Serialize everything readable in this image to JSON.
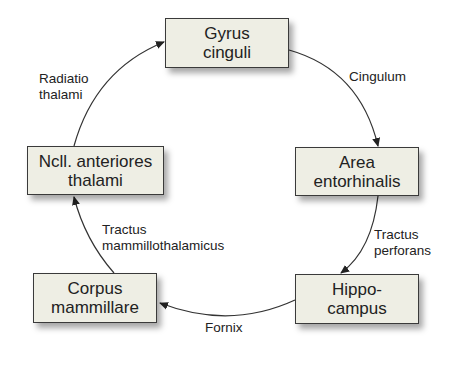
{
  "nodes": {
    "gyrus": {
      "line1": "Gyrus",
      "line2": "cinguli"
    },
    "area": {
      "line1": "Area",
      "line2": "entorhinalis"
    },
    "hippo": {
      "line1": "Hippo-",
      "line2": "campus"
    },
    "corpus": {
      "line1": "Corpus",
      "line2": "mammillare"
    },
    "ncll": {
      "line1": "Ncll. anteriores",
      "line2": "thalami"
    }
  },
  "edges": {
    "cingulum": {
      "line1": "Cingulum"
    },
    "perforans": {
      "line1": "Tractus",
      "line2": "perforans"
    },
    "fornix": {
      "line1": "Fornix"
    },
    "mammillo": {
      "line1": "Tractus",
      "line2": "mammillothalamicus"
    },
    "radiatio": {
      "line1": "Radiatio",
      "line2": "thalami"
    }
  },
  "colors": {
    "box_fill": "#eeeee4",
    "stroke": "#3a3a3a"
  }
}
